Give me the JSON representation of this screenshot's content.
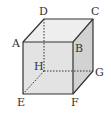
{
  "diagram": {
    "type": "cube",
    "colors": {
      "edge": "#333333",
      "top_face": "#eeeeee",
      "front_face": "#e3e3e3",
      "right_face": "#d2d2d2",
      "background": "#ffffff"
    },
    "vertices": {
      "A": {
        "label": "A",
        "x": 23,
        "y": 42
      },
      "B": {
        "label": "B",
        "x": 73,
        "y": 42
      },
      "C": {
        "label": "C",
        "x": 93,
        "y": 19
      },
      "D": {
        "label": "D",
        "x": 44,
        "y": 19
      },
      "E": {
        "label": "E",
        "x": 23,
        "y": 94
      },
      "F": {
        "label": "F",
        "x": 73,
        "y": 94
      },
      "G": {
        "label": "G",
        "x": 93,
        "y": 71
      },
      "H": {
        "label": "H",
        "x": 44,
        "y": 71
      }
    },
    "visible_edges": [
      "AB",
      "BC",
      "CD",
      "DA",
      "AE",
      "EF",
      "FB",
      "FG",
      "GC"
    ],
    "hidden_edges": [
      "DH",
      "HE",
      "HG"
    ]
  }
}
